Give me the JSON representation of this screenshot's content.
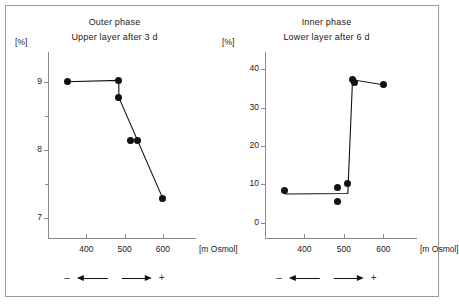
{
  "figure": {
    "border_color": "#9a9a9a",
    "marker_color": "#111111",
    "axis_color": "#8a8a8a"
  },
  "panels": [
    {
      "key": "outer",
      "title_line1": "Outer phase",
      "title_line2": "Upper layer after 3 d",
      "y_unit": "[%]",
      "x_unit": "[m Osmol]",
      "y_ticks": [
        "9",
        "8",
        "7"
      ],
      "x_ticks": [
        "400",
        "500",
        "600"
      ],
      "arrows": {
        "minus": "–",
        "plus": "+"
      }
    },
    {
      "key": "inner",
      "title_line1": "Inner phase",
      "title_line2": "Lower layer after 6 d",
      "y_unit": "[%]",
      "x_unit": "[m Osmol]",
      "y_ticks": [
        "40",
        "30",
        "20",
        "10",
        "0"
      ],
      "x_ticks": [
        "400",
        "500",
        "600"
      ],
      "arrows": {
        "minus": "–",
        "plus": "+"
      }
    }
  ],
  "chart_data": [
    {
      "type": "scatter",
      "title": "Outer phase — Upper layer after 3 d",
      "xlabel": "[m Osmol]",
      "ylabel": "[%]",
      "xlim": [
        300,
        650
      ],
      "ylim": [
        6.7,
        9.35
      ],
      "xticks": [
        400,
        500,
        600
      ],
      "yticks": [
        9,
        8,
        7
      ],
      "yminorticks": [
        8.5,
        7.5
      ],
      "grid": false,
      "legend": null,
      "x": [
        350,
        485,
        485,
        515,
        535,
        600
      ],
      "y": [
        9.0,
        9.02,
        8.77,
        8.13,
        8.14,
        7.28
      ],
      "line_path_x": [
        350,
        485,
        485,
        600
      ],
      "line_path_y": [
        9.0,
        9.02,
        8.77,
        7.28
      ],
      "annotation_left": "–",
      "annotation_right": "+"
    },
    {
      "type": "scatter",
      "title": "Inner phase — Lower layer after 6 d",
      "xlabel": "[m Osmol]",
      "ylabel": "[%]",
      "xlim": [
        300,
        650
      ],
      "ylim": [
        -4,
        43
      ],
      "xticks": [
        400,
        500,
        600
      ],
      "yticks": [
        40,
        30,
        20,
        10,
        0
      ],
      "grid": false,
      "legend": null,
      "x": [
        350,
        485,
        485,
        510,
        522,
        528,
        600
      ],
      "y": [
        8.3,
        9.2,
        5.5,
        10.3,
        37.3,
        36.5,
        36.0
      ],
      "line_path_x": [
        350,
        510,
        522,
        600
      ],
      "line_path_y": [
        7.5,
        7.6,
        37.3,
        36.0
      ],
      "annotation_left": "–",
      "annotation_right": "+"
    }
  ]
}
